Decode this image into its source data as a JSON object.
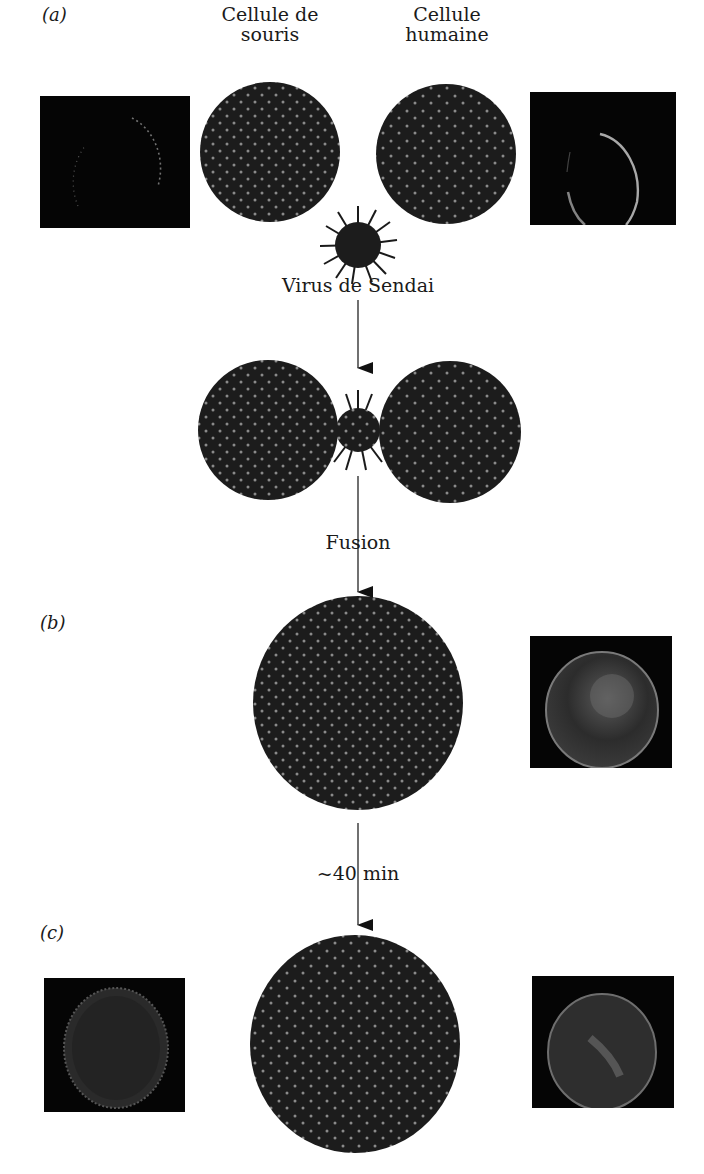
{
  "figure": {
    "panels": {
      "a": "(a)",
      "b": "(b)",
      "c": "(c)"
    },
    "labels": {
      "mouse_cell": [
        "Cellule de",
        "souris"
      ],
      "human_cell": [
        "Cellule",
        "humaine"
      ],
      "virus": "Virus de Sendai",
      "fusion": "Fusion",
      "time": "~40 min"
    },
    "colors": {
      "cell_fill": "#1c1c1c",
      "dot": "#8a8a8a",
      "micrograph_bg": "#050505",
      "glow": "#9a9a9a",
      "arrow": "#111111"
    }
  }
}
